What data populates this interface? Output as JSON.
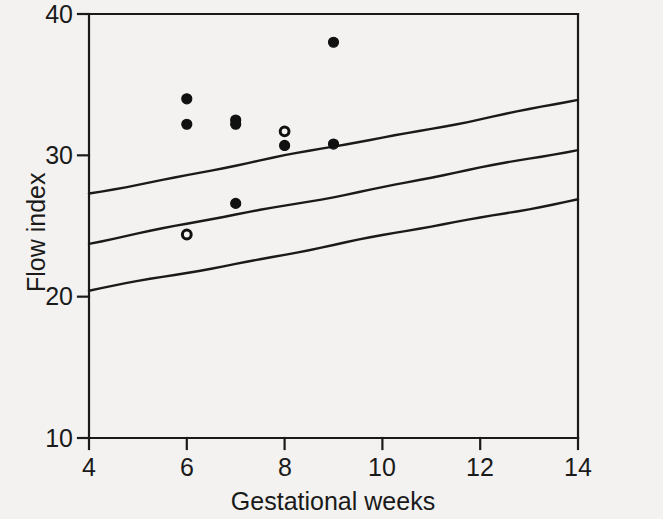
{
  "figure": {
    "background_color": "#f3f2f0",
    "ink_color": "#1a1a1a"
  },
  "chart_data": {
    "type": "scatter",
    "title": "",
    "subtitle": "",
    "xlabel": "Gestational weeks",
    "ylabel": "Flow index",
    "xlim": [
      4,
      14
    ],
    "ylim": [
      10,
      40
    ],
    "xticks": [
      4,
      6,
      8,
      10,
      12,
      14
    ],
    "xtick_labels": [
      "4",
      "6",
      "8",
      "10",
      "12",
      "14"
    ],
    "yticks": [
      10,
      20,
      30,
      40
    ],
    "ytick_labels": [
      "10",
      "20",
      "30",
      "40"
    ],
    "grid": false,
    "legend": null,
    "legend_position": "none",
    "annotations": [],
    "series": [
      {
        "name": "Flow index observations (filled)",
        "marker": "filled-circle",
        "marker_color": "#111111",
        "points": [
          {
            "x": 6,
            "y": 34.0
          },
          {
            "x": 6,
            "y": 32.2
          },
          {
            "x": 7,
            "y": 32.5
          },
          {
            "x": 7,
            "y": 32.2
          },
          {
            "x": 7,
            "y": 26.6
          },
          {
            "x": 8,
            "y": 30.7
          },
          {
            "x": 9,
            "y": 38.0
          },
          {
            "x": 9,
            "y": 30.8
          }
        ]
      },
      {
        "name": "Flow index observations (open)",
        "marker": "open-circle",
        "marker_color": "#111111",
        "points": [
          {
            "x": 6,
            "y": 24.4
          },
          {
            "x": 8,
            "y": 31.7
          }
        ]
      }
    ],
    "reference_lines": [
      {
        "name": "upper reference limit",
        "style": "solid",
        "x": [
          4,
          14
        ],
        "y": [
          27.3,
          33.9
        ]
      },
      {
        "name": "mean regression line",
        "style": "solid",
        "x": [
          4,
          14
        ],
        "y": [
          23.8,
          30.4
        ]
      },
      {
        "name": "lower reference limit",
        "style": "solid",
        "x": [
          4,
          14
        ],
        "y": [
          20.4,
          26.9
        ]
      }
    ]
  }
}
